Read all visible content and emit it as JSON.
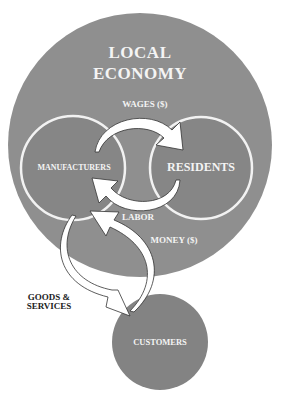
{
  "diagram": {
    "title_line1": "LOCAL",
    "title_line2": "ECONOMY",
    "nodes": {
      "manufacturers": "MANUFACTURERS",
      "residents": "RESIDENTS",
      "customers": "CUSTOMERS"
    },
    "flows": {
      "wages": "WAGES ($)",
      "labor": "LABOR",
      "money": "MONEY ($)",
      "goods_line1": "GOODS &",
      "goods_line2": "SERVICES"
    },
    "colors": {
      "outer_circle": "#8f8f8f",
      "inner_circle": "#868686",
      "customers_circle": "#838383",
      "ring_stroke": "#f2f2f2",
      "arrow_fill": "#ffffff",
      "arrow_stroke": "#333333",
      "label_light": "#f4f4f4",
      "label_dark": "#222222"
    }
  }
}
